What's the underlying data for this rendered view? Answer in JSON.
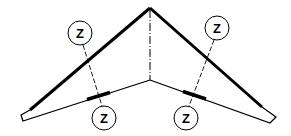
{
  "diagram": {
    "stroke_color": "#000000",
    "background": "#ffffff",
    "markers": [
      {
        "id": "left-top",
        "label": "Z"
      },
      {
        "id": "left-bottom",
        "label": "Z"
      },
      {
        "id": "right-top",
        "label": "Z"
      },
      {
        "id": "right-bottom",
        "label": "Z"
      }
    ]
  }
}
